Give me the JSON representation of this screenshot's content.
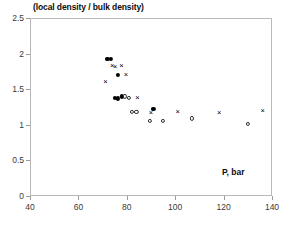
{
  "chart_data": {
    "type": "scatter",
    "title": "",
    "ylabel": "(local density / bulk density)",
    "xlabel": "P, bar",
    "xlim": [
      40,
      140
    ],
    "ylim": [
      0,
      2.5
    ],
    "xticks": [
      "40",
      "60",
      "80",
      "100",
      "120",
      "140"
    ],
    "xtick_values": [
      40,
      60,
      80,
      100,
      120,
      140
    ],
    "yticks": [
      "0",
      "0.5",
      "1",
      "1.5",
      "2",
      "2.5"
    ],
    "ytick_values": [
      0,
      0.5,
      1,
      1.5,
      2,
      2.5
    ],
    "grid": false,
    "legend": "none",
    "series": [
      {
        "name": "filled-circle",
        "marker": "filled circle",
        "color": "#000000",
        "points": [
          [
            72.0,
            1.93
          ],
          [
            73.5,
            1.92
          ],
          [
            76.2,
            1.7
          ],
          [
            75.0,
            1.38
          ],
          [
            76.3,
            1.37
          ],
          [
            78.0,
            1.4
          ],
          [
            91.0,
            1.22
          ]
        ]
      },
      {
        "name": "open-circle",
        "marker": "open circle",
        "color": "#2b2b2b",
        "points": [
          [
            79.3,
            1.4
          ],
          [
            80.8,
            1.38
          ],
          [
            82.2,
            1.18
          ],
          [
            84.0,
            1.18
          ],
          [
            89.6,
            1.05
          ],
          [
            94.8,
            1.05
          ],
          [
            107.0,
            1.09
          ],
          [
            130.0,
            1.01
          ]
        ]
      },
      {
        "name": "cross",
        "marker": "x",
        "color": "#000000",
        "points": [
          [
            71.2,
            1.6
          ],
          [
            74.0,
            1.82
          ],
          [
            75.2,
            1.81
          ],
          [
            77.8,
            1.83
          ],
          [
            79.6,
            1.7
          ],
          [
            84.4,
            1.38
          ],
          [
            90.0,
            1.16
          ],
          [
            101.0,
            1.18
          ],
          [
            118.2,
            1.17
          ],
          [
            136.2,
            1.2
          ]
        ]
      }
    ]
  }
}
